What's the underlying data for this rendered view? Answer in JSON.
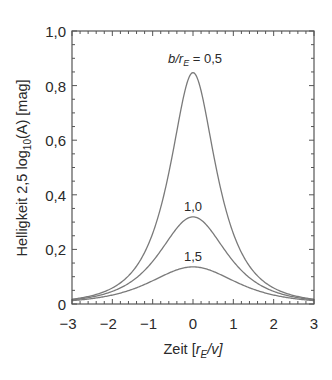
{
  "chart_data": {
    "type": "line",
    "title": "",
    "xlabel": "Zeit [r_E/v]",
    "ylabel": "Helligkeit 2,5 log10(A) [mag]",
    "xlim": [
      -3,
      3
    ],
    "ylim": [
      0,
      1.0
    ],
    "grid": false,
    "x_ticks": [
      "−3",
      "−2",
      "−1",
      "0",
      "1",
      "2",
      "3"
    ],
    "y_ticks": [
      "0",
      "0,2",
      "0,4",
      "0,6",
      "0,8",
      "1,0"
    ],
    "annotation": "b/r_E = 0,5",
    "x": [
      -3.0,
      -2.5,
      -2.0,
      -1.5,
      -1.0,
      -0.75,
      -0.5,
      -0.25,
      0.0,
      0.25,
      0.5,
      0.75,
      1.0,
      1.5,
      2.0,
      2.5,
      3.0
    ],
    "series": [
      {
        "name": "0,5",
        "label": "b/r_E = 0,5",
        "peak": 0.85,
        "values": [
          0.014,
          0.026,
          0.053,
          0.115,
          0.279,
          0.42,
          0.596,
          0.775,
          0.847,
          0.775,
          0.596,
          0.42,
          0.279,
          0.115,
          0.053,
          0.026,
          0.014
        ]
      },
      {
        "name": "1,0",
        "label": "1,0",
        "peak": 0.32,
        "values": [
          0.012,
          0.022,
          0.042,
          0.08,
          0.149,
          0.191,
          0.243,
          0.295,
          0.319,
          0.295,
          0.243,
          0.191,
          0.149,
          0.08,
          0.042,
          0.022,
          0.012
        ]
      },
      {
        "name": "1,5",
        "label": "1,5",
        "peak": 0.14,
        "values": [
          0.009,
          0.016,
          0.028,
          0.048,
          0.079,
          0.097,
          0.115,
          0.13,
          0.136,
          0.13,
          0.115,
          0.097,
          0.079,
          0.048,
          0.028,
          0.016,
          0.009
        ]
      }
    ],
    "line_color": "#7a7a7a"
  },
  "labels": {
    "xlabel_prefix": "Zeit [",
    "xlabel_r": "r",
    "xlabel_sub": "E",
    "xlabel_suffix": "/v]",
    "ylabel_text": "Helligkeit 2,5 log",
    "ylabel_sub": "10",
    "ylabel_suffix": "(A) [mag]",
    "annotation_b": "b/r",
    "annotation_sub": "E",
    "annotation_val": " = 0,5",
    "label_10": "1,0",
    "label_15": "1,5"
  }
}
